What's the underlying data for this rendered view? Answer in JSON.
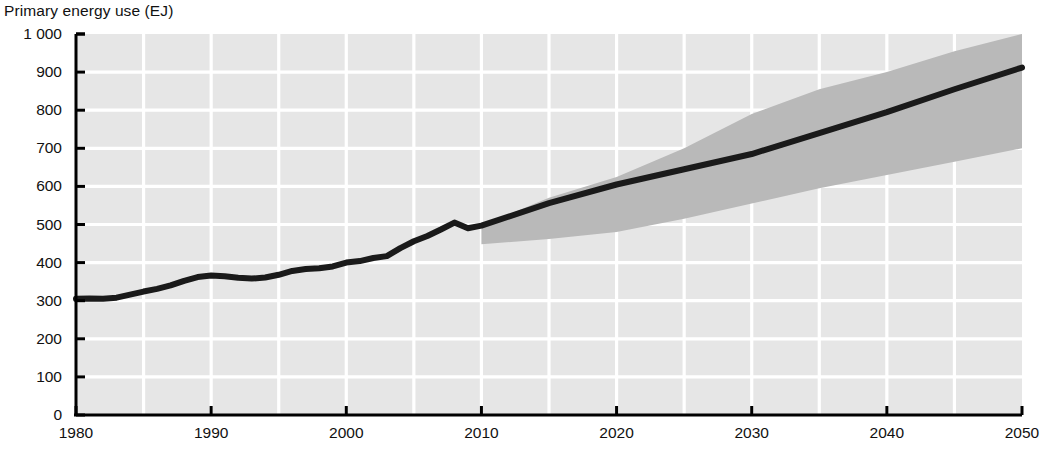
{
  "chart_data": {
    "type": "line",
    "title": "Primary energy use (EJ)",
    "xlabel": "",
    "ylabel": "Primary energy use (EJ)",
    "xlim": [
      1980,
      2050
    ],
    "ylim": [
      0,
      1000
    ],
    "grid": true,
    "legend_position": "none",
    "y_ticks": [
      "0",
      "100",
      "200",
      "300",
      "400",
      "500",
      "600",
      "700",
      "800",
      "900",
      "1 000"
    ],
    "y_tick_values": [
      0,
      100,
      200,
      300,
      400,
      500,
      600,
      700,
      800,
      900,
      1000
    ],
    "x_ticks": [
      "1980",
      "1990",
      "2000",
      "2010",
      "2020",
      "2030",
      "2040",
      "2050"
    ],
    "x_tick_values": [
      1980,
      1990,
      2000,
      2010,
      2020,
      2030,
      2040,
      2050
    ],
    "x_minor_step": 5,
    "annotations": [],
    "series": [
      {
        "name": "Primary energy use",
        "type": "line",
        "color": "#1a1a1a",
        "x": [
          1980,
          1981,
          1982,
          1983,
          1984,
          1985,
          1986,
          1987,
          1988,
          1989,
          1990,
          1991,
          1992,
          1993,
          1994,
          1995,
          1996,
          1997,
          1998,
          1999,
          2000,
          2001,
          2002,
          2003,
          2004,
          2005,
          2006,
          2007,
          2008,
          2009,
          2010,
          2015,
          2020,
          2025,
          2030,
          2035,
          2040,
          2045,
          2050
        ],
        "values": [
          305,
          306,
          305,
          308,
          316,
          324,
          331,
          340,
          352,
          362,
          366,
          364,
          360,
          358,
          361,
          368,
          378,
          383,
          385,
          390,
          400,
          404,
          412,
          417,
          438,
          456,
          470,
          487,
          505,
          490,
          497,
          556,
          605,
          645,
          685,
          740,
          795,
          855,
          912
        ]
      },
      {
        "name": "Uncertainty range (high)",
        "type": "band-upper",
        "color": "#b8b8b8",
        "x": [
          2010,
          2015,
          2020,
          2025,
          2030,
          2035,
          2040,
          2045,
          2050
        ],
        "values": [
          497,
          570,
          625,
          700,
          790,
          855,
          900,
          955,
          1000
        ]
      },
      {
        "name": "Uncertainty range (low)",
        "type": "band-lower",
        "color": "#b8b8b8",
        "x": [
          2010,
          2015,
          2020,
          2025,
          2030,
          2035,
          2040,
          2045,
          2050
        ],
        "values": [
          448,
          462,
          480,
          515,
          555,
          595,
          630,
          665,
          700
        ]
      }
    ],
    "colors": {
      "plot_background": "#e6e6e6",
      "gridline": "#ffffff",
      "axis": "#000000",
      "line": "#1a1a1a",
      "band": "#b9b9b9"
    }
  }
}
